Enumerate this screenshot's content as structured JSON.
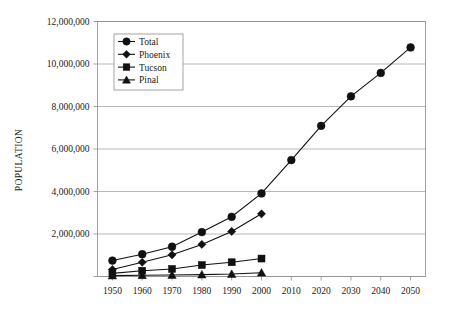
{
  "chart_data": {
    "type": "line",
    "title": "",
    "subtitle": "",
    "xlabel": "",
    "ylabel": "POPULATION",
    "x": [
      1950,
      1960,
      1970,
      1980,
      1990,
      2000,
      2010,
      2020,
      2030,
      2040,
      2050
    ],
    "categories": [
      "1950",
      "1960",
      "1970",
      "1980",
      "1990",
      "2000",
      "2010",
      "2020",
      "2030",
      "2040",
      "2050"
    ],
    "xlim": [
      1945,
      2055
    ],
    "ylim": [
      0,
      12000000
    ],
    "ytick_values": [
      0,
      2000000,
      4000000,
      6000000,
      8000000,
      10000000,
      12000000
    ],
    "ytick_labels": [
      "",
      "2,000,000",
      "4,000,000",
      "6,000,000",
      "8,000,000",
      "10,000,000",
      "12,000,000"
    ],
    "grid": true,
    "legend_position": "top-left",
    "series": [
      {
        "name": "Total",
        "marker": "circle",
        "color": "#111111",
        "x": [
          1950,
          1960,
          1970,
          1980,
          1990,
          2000,
          2010,
          2020,
          2030,
          2040,
          2050
        ],
        "values": [
          750000,
          1050000,
          1400000,
          2090000,
          2810000,
          3910000,
          5480000,
          7090000,
          8480000,
          9580000,
          10780000
        ]
      },
      {
        "name": "Phoenix",
        "marker": "diamond",
        "color": "#111111",
        "x": [
          1950,
          1960,
          1970,
          1980,
          1990,
          2000
        ],
        "values": [
          330000,
          670000,
          1020000,
          1510000,
          2120000,
          2950000
        ]
      },
      {
        "name": "Tucson",
        "marker": "square",
        "color": "#111111",
        "x": [
          1950,
          1960,
          1970,
          1980,
          1990,
          2000
        ],
        "values": [
          145000,
          270000,
          355000,
          540000,
          670000,
          845000
        ]
      },
      {
        "name": "Pinal",
        "marker": "triangle",
        "color": "#111111",
        "x": [
          1950,
          1960,
          1970,
          1980,
          1990,
          2000
        ],
        "values": [
          43000,
          62000,
          68000,
          90000,
          116000,
          180000
        ]
      }
    ]
  },
  "legend": {
    "items": [
      {
        "label": "Total",
        "marker": "circle"
      },
      {
        "label": "Phoenix",
        "marker": "diamond"
      },
      {
        "label": "Tucson",
        "marker": "square"
      },
      {
        "label": "Pinal",
        "marker": "triangle"
      }
    ]
  }
}
